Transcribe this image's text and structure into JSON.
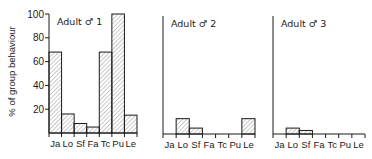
{
  "chart_data": [
    {
      "type": "bar",
      "title": "Adult ♂ 1",
      "categories": [
        "Ja",
        "Lo",
        "Sf",
        "Fa",
        "Tc",
        "Pu",
        "Le"
      ],
      "values": [
        68,
        16,
        8,
        5,
        68,
        100,
        15
      ],
      "xlabel": "",
      "ylabel": "% of group behaviour",
      "ylim": [
        0,
        100
      ],
      "yticks": [
        20,
        40,
        60,
        80,
        100
      ],
      "grid": false
    },
    {
      "type": "bar",
      "title": "Adult ♂ 2",
      "categories": [
        "Ja",
        "Lo",
        "Sf",
        "Fa",
        "Tc",
        "Pu",
        "Le"
      ],
      "values": [
        0,
        13,
        5,
        0,
        0,
        0,
        13
      ],
      "xlabel": "",
      "ylabel": "% of group behaviour",
      "ylim": [
        0,
        100
      ],
      "grid": false
    },
    {
      "type": "bar",
      "title": "Adult ♂ 3",
      "categories": [
        "Ja",
        "Lo",
        "Sf",
        "Fa",
        "Tc",
        "Pu",
        "Le"
      ],
      "values": [
        0,
        5,
        3,
        0,
        0,
        0,
        0
      ],
      "xlabel": "",
      "ylabel": "% of group behaviour",
      "ylim": [
        0,
        100
      ],
      "grid": false
    }
  ],
  "ylabel": "% of group behaviour",
  "colors": {
    "line": "#1a1a1a",
    "hatch": "#777777"
  }
}
